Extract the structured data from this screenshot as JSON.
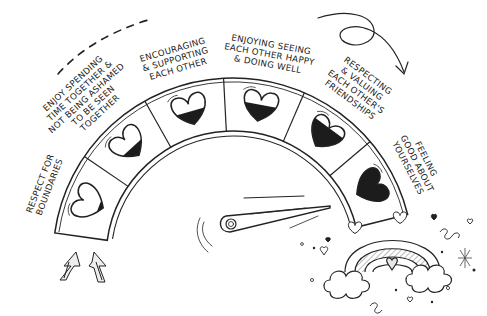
{
  "illustration": {
    "subject": "friendship meter gauge",
    "gauge": {
      "segments": [
        {
          "label_lines": [
            "Respect for",
            "boundaries"
          ],
          "heart_fill": 0.15,
          "heart_icon": "heart-tilted-icon"
        },
        {
          "label_lines": [
            "Enjoy spending",
            "time together &",
            "not being ashamed",
            "to be seen",
            "together"
          ],
          "heart_fill": 0.35,
          "heart_icon": "heart-icon"
        },
        {
          "label_lines": [
            "Encouraging",
            "& supporting",
            "each other"
          ],
          "heart_fill": 0.45,
          "heart_icon": "heart-icon"
        },
        {
          "label_lines": [
            "Enjoying seeing",
            "each other happy",
            "& doing well"
          ],
          "heart_fill": 0.55,
          "heart_icon": "heart-icon"
        },
        {
          "label_lines": [
            "Respecting",
            "& valuing",
            "each other's",
            "friendships"
          ],
          "heart_fill": 0.75,
          "heart_icon": "heart-icon"
        },
        {
          "label_lines": [
            "Feeling",
            "good about",
            "yourselves"
          ],
          "heart_fill": 1.0,
          "heart_icon": "heart-icon"
        }
      ],
      "needle_icon": "needle-pointer-icon"
    },
    "decorations": {
      "arrows_up": "double-up-arrow-icon",
      "curved_arrow": "curved-arrow-icon",
      "rainbow": "rainbow-icon",
      "clouds": "cloud-icon",
      "small_hearts": "heart-doodle-icon",
      "sparkle": "sparkle-icon"
    },
    "colors": {
      "ink": "#222222",
      "paper": "#ffffff",
      "shade": "#d8d8d8"
    }
  }
}
